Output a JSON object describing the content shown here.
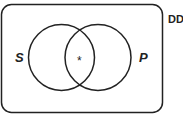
{
  "diagram": {
    "type": "venn",
    "universe_label": "DD",
    "sets": [
      {
        "name": "S",
        "label": "S"
      },
      {
        "name": "P",
        "label": "P"
      }
    ],
    "intersection_mark": "*",
    "stroke_color": "#222222",
    "background": "#ffffff"
  }
}
